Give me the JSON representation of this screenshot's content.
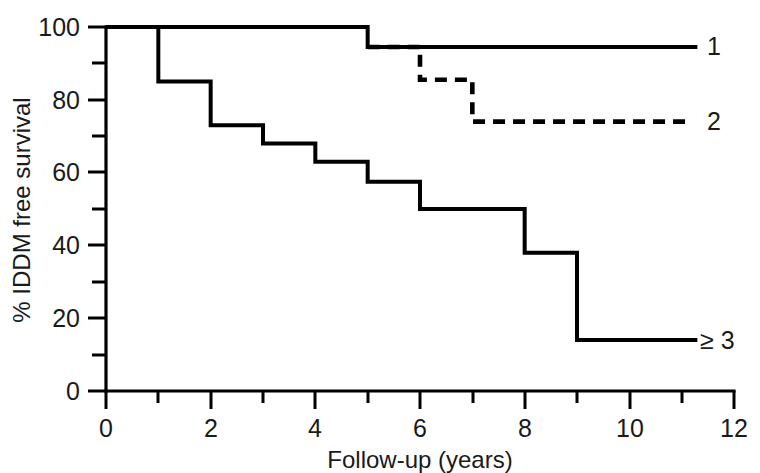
{
  "chart_data": {
    "type": "line",
    "title": "",
    "xlabel": "Follow-up (years)",
    "ylabel": "% IDDM free survival",
    "xlim": [
      0,
      12
    ],
    "ylim": [
      0,
      100
    ],
    "grid": false,
    "legend_position": "right-of-curve-end",
    "x_ticks_major": [
      0,
      2,
      4,
      6,
      8,
      10,
      12
    ],
    "x_ticks_minor": [
      1,
      3,
      5,
      7,
      9,
      11
    ],
    "x_tick_labels": [
      "0",
      "2",
      "4",
      "6",
      "8",
      "10",
      "12"
    ],
    "y_ticks_major": [
      0,
      20,
      40,
      60,
      80,
      100
    ],
    "y_ticks_minor": [
      10,
      30,
      50,
      70,
      90
    ],
    "y_tick_labels": [
      "0",
      "20",
      "40",
      "60",
      "80",
      "100"
    ],
    "series": [
      {
        "name": "1",
        "label": "1",
        "style": "solid",
        "step": "post",
        "x": [
          0,
          5,
          5,
          11.3
        ],
        "y": [
          100,
          100,
          94.5,
          94.5
        ]
      },
      {
        "name": "2",
        "label": "2",
        "style": "dashed",
        "step": "post",
        "x": [
          5,
          6,
          6,
          7,
          7,
          11.2
        ],
        "y": [
          94.5,
          94.5,
          85.5,
          85.5,
          74,
          74
        ]
      },
      {
        "name": "3",
        "label": "≥ 3",
        "style": "solid",
        "step": "post",
        "x": [
          0,
          1,
          1,
          2,
          2,
          3,
          3,
          4,
          4,
          5,
          5,
          6,
          6,
          8,
          8,
          9,
          9,
          11.3
        ],
        "y": [
          100,
          100,
          85,
          85,
          73,
          73,
          68,
          68,
          63,
          63,
          57.5,
          57.5,
          50,
          50,
          38,
          38,
          14,
          14
        ]
      }
    ]
  },
  "labels": {
    "curve1": "1",
    "curve2": "2",
    "curve3": "≥ 3",
    "x_axis_title": "Follow-up (years)",
    "y_axis_title": "% IDDM free survival",
    "x0": "0",
    "x2": "2",
    "x4": "4",
    "x6": "6",
    "x8": "8",
    "x10": "10",
    "x12": "12",
    "y0": "0",
    "y20": "20",
    "y40": "40",
    "y60": "60",
    "y80": "80",
    "y100": "100"
  },
  "colors": {
    "ink": "#000000",
    "background": "#ffffff"
  }
}
